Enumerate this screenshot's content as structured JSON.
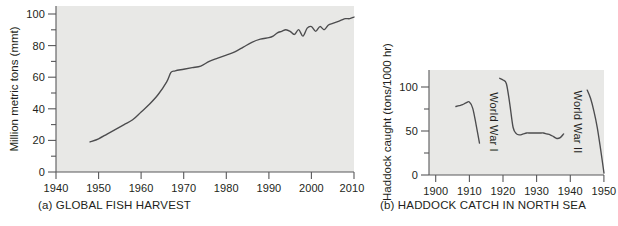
{
  "figure": {
    "panels": [
      {
        "id": "a",
        "caption": "(a) GLOBAL FISH HARVEST",
        "ylabel": "Million metric tons (mmt)",
        "xlabel": "",
        "xticks": [
          "1940",
          "1950",
          "1960",
          "1970",
          "1980",
          "1990",
          "2000",
          "2010"
        ],
        "yticks": [
          "0",
          "20",
          "40",
          "60",
          "80",
          "100"
        ]
      },
      {
        "id": "b",
        "caption": "(b) HADDOCK CATCH IN NORTH SEA",
        "ylabel": "Haddock caught (tons/1000 hr)",
        "xlabel": "",
        "xticks": [
          "1900",
          "1910",
          "1920",
          "1930",
          "1940",
          "1950"
        ],
        "yticks": [
          "0",
          "50",
          "100"
        ],
        "annotations": [
          "World War I",
          "World War II"
        ]
      }
    ]
  },
  "colors": {
    "plot_background": "#e8e8e6",
    "line": "#4c4c4e",
    "axis": "#58585a",
    "text": "#231f20",
    "page_background": "#ffffff"
  },
  "chart_data": [
    {
      "type": "line",
      "title": "(a) GLOBAL FISH HARVEST",
      "xlabel": "",
      "ylabel": "Million metric tons (mmt)",
      "xlim": [
        1940,
        2010
      ],
      "ylim": [
        0,
        105
      ],
      "xticks": [
        1940,
        1950,
        1960,
        1970,
        1980,
        1990,
        2000,
        2010
      ],
      "yticks": [
        0,
        20,
        40,
        60,
        80,
        100
      ],
      "yminorticks": [
        10,
        30,
        50,
        70,
        90
      ],
      "grid": false,
      "legend": null,
      "series": [
        {
          "name": "Global fish harvest",
          "x": [
            1948,
            1950,
            1952,
            1954,
            1956,
            1958,
            1960,
            1962,
            1964,
            1966,
            1967,
            1968,
            1970,
            1972,
            1974,
            1976,
            1978,
            1980,
            1982,
            1984,
            1986,
            1988,
            1990,
            1991,
            1992,
            1993,
            1994,
            1995,
            1996,
            1997,
            1998,
            1999,
            2000,
            2001,
            2002,
            2003,
            2004,
            2005,
            2006,
            2007,
            2008,
            2009,
            2010
          ],
          "values": [
            19,
            21,
            24,
            27,
            30,
            33,
            38,
            43,
            49,
            57,
            63,
            64,
            65,
            66,
            67,
            70,
            72,
            74,
            76,
            79,
            82,
            84,
            85,
            86,
            88,
            89,
            90,
            89,
            87,
            90,
            86,
            91,
            92,
            89,
            92,
            90,
            93,
            94,
            95,
            96,
            97,
            97,
            98
          ]
        }
      ]
    },
    {
      "type": "line",
      "title": "(b) HADDOCK CATCH IN NORTH SEA",
      "xlabel": "",
      "ylabel": "Haddock caught (tons/1000 hr)",
      "xlim": [
        1898,
        1950
      ],
      "ylim": [
        0,
        115
      ],
      "xticks": [
        1900,
        1910,
        1920,
        1930,
        1940,
        1950
      ],
      "yticks": [
        0,
        50,
        100
      ],
      "yminorticks": [
        25,
        75
      ],
      "grid": false,
      "legend": null,
      "annotations": [
        {
          "text": "World War I",
          "x": 1916,
          "orientation": "vertical"
        },
        {
          "text": "World War II",
          "x": 1941,
          "orientation": "vertical"
        }
      ],
      "series": [
        {
          "name": "Pre-WWI catch",
          "x": [
            1906,
            1907,
            1908,
            1909,
            1910,
            1911,
            1912,
            1913
          ],
          "values": [
            75,
            76,
            77,
            79,
            80,
            73,
            55,
            35
          ]
        },
        {
          "name": "Interwar catch",
          "x": [
            1919,
            1920,
            1921,
            1922,
            1923,
            1924,
            1925,
            1926,
            1927,
            1928,
            1929,
            1930,
            1931,
            1932,
            1933,
            1934,
            1935,
            1936,
            1937,
            1938
          ],
          "values": [
            106,
            104,
            100,
            78,
            52,
            45,
            44,
            45,
            46,
            46,
            46,
            46,
            46,
            46,
            45,
            44,
            42,
            40,
            41,
            45
          ]
        },
        {
          "name": "Post-WWII catch",
          "x": [
            1945,
            1946,
            1947,
            1948,
            1949,
            1950
          ],
          "values": [
            93,
            84,
            70,
            52,
            28,
            2
          ]
        }
      ]
    }
  ]
}
